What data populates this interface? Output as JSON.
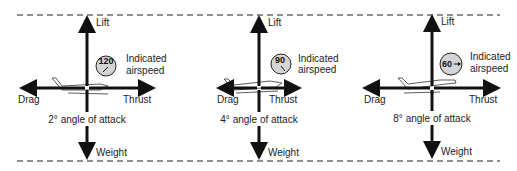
{
  "diagram": {
    "colors": {
      "arrow": "#111111",
      "gauge_fill": "#d4d4d4",
      "dashed_line": "#222222",
      "text": "#222222"
    },
    "force_labels": {
      "lift": "Lift",
      "weight": "Weight",
      "drag": "Drag",
      "thrust": "Thrust"
    },
    "panels": [
      {
        "id": "panel-1",
        "airspeed": "120",
        "airspeed_label_line1": "Indicated",
        "airspeed_label_line2": "airspeed",
        "aoa_label": "2° angle of attack",
        "needle": "down-left",
        "drag_length": "long",
        "thrust_length": "long"
      },
      {
        "id": "panel-2",
        "airspeed": "90",
        "airspeed_label_line1": "Indicated",
        "airspeed_label_line2": "airspeed",
        "aoa_label": "4° angle of attack",
        "needle": "down-right",
        "drag_length": "short",
        "thrust_length": "short"
      },
      {
        "id": "panel-3",
        "airspeed": "60",
        "airspeed_label_line1": "Indicated",
        "airspeed_label_line2": "airspeed",
        "aoa_label": "8° angle of attack",
        "needle": "right",
        "drag_length": "long",
        "thrust_length": "long"
      }
    ]
  }
}
